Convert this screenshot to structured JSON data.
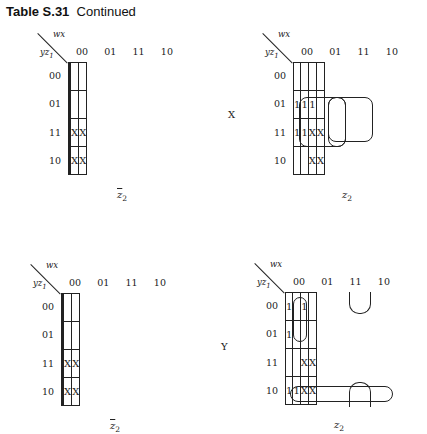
{
  "title": {
    "label": "Table S.31",
    "suffix": "Continued"
  },
  "col_var": "wx",
  "row_var": "yz",
  "row_var_sub": "1",
  "col_headers": [
    "00",
    "01",
    "11",
    "10"
  ],
  "row_headers": [
    "00",
    "01",
    "11",
    "10"
  ],
  "side_labels": {
    "X": "X",
    "Y": "Y"
  },
  "maps": [
    {
      "id": "map1",
      "caption": "z",
      "caption_sub": "2",
      "caption_bar": true,
      "cells": [
        [
          "",
          "",
          "",
          ""
        ],
        [
          "",
          "",
          "",
          ""
        ],
        [
          "",
          "",
          "X",
          "X"
        ],
        [
          "",
          "",
          "X",
          "X"
        ]
      ]
    },
    {
      "id": "map2",
      "caption": "z",
      "caption_sub": "2",
      "caption_bar": false,
      "cells": [
        [
          "",
          "",
          "",
          ""
        ],
        [
          "1",
          "1",
          "1",
          ""
        ],
        [
          "1",
          "1",
          "X",
          "X"
        ],
        [
          "",
          "",
          "X",
          "X"
        ]
      ]
    },
    {
      "id": "map3",
      "caption": "z",
      "caption_sub": "2",
      "caption_bar": true,
      "cells": [
        [
          "",
          "",
          "",
          ""
        ],
        [
          "",
          "",
          "",
          ""
        ],
        [
          "",
          "",
          "X",
          "X"
        ],
        [
          "",
          "",
          "X",
          "X"
        ]
      ]
    },
    {
      "id": "map4",
      "caption": "z",
      "caption_sub": "2",
      "caption_bar": false,
      "cells": [
        [
          "1",
          "",
          "1",
          ""
        ],
        [
          "1",
          "",
          "",
          ""
        ],
        [
          "",
          "",
          "X",
          "X"
        ],
        [
          "1",
          "1",
          "X",
          "X"
        ]
      ]
    }
  ]
}
